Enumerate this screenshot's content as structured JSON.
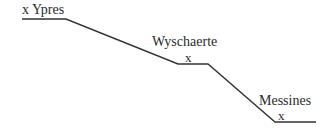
{
  "diagram": {
    "type": "elevation-profile",
    "line_color": "#333333",
    "points": [
      {
        "name": "Ypres",
        "label": "x Ypres"
      },
      {
        "name": "Wyschaerte",
        "label": "Wyschaerte",
        "marker": "x"
      },
      {
        "name": "Messines",
        "label": "Messines",
        "marker": "x"
      }
    ]
  }
}
